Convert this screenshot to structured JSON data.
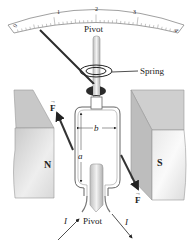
{
  "scale": {
    "ticks": [
      "0",
      "1",
      "2",
      "3",
      "4"
    ]
  },
  "labels": {
    "pivot_top": "Pivot",
    "pivot_bottom": "Pivot",
    "spring": "Spring",
    "north": "N",
    "south": "S",
    "side_a": "a",
    "side_b": "b",
    "force_left": "F",
    "force_right": "F",
    "current_in": "I",
    "current_out": "I"
  },
  "colors": {
    "magnet_face": "#d9d9d9",
    "magnet_side": "#c4c4c4",
    "magnet_top": "#cfcfcf",
    "needle": "#2b2b2b",
    "loop": "#666666",
    "force_arrow": "#333333"
  }
}
